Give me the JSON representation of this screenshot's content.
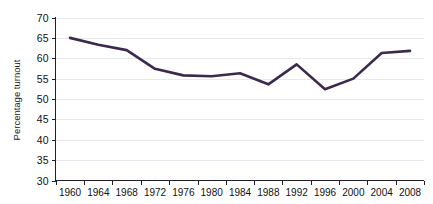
{
  "chart_data": {
    "type": "line",
    "title": "",
    "subtitle": "",
    "xlabel": "",
    "ylabel": "Percentage turnout",
    "x": [
      1960,
      1964,
      1968,
      1972,
      1976,
      1980,
      1984,
      1988,
      1992,
      1996,
      2000,
      2004,
      2008
    ],
    "x_tick_labels": [
      "1960",
      "1964",
      "1968",
      "1972",
      "1976",
      "1980",
      "1984",
      "1988",
      "1992",
      "1996",
      "2000",
      "2004",
      "2008"
    ],
    "y_tick_labels": [
      "70",
      "65",
      "60",
      "55",
      "50",
      "45",
      "40",
      "35",
      "30"
    ],
    "y_ticks": [
      70,
      65,
      60,
      55,
      50,
      45,
      40,
      35,
      30
    ],
    "ylim": [
      30,
      70
    ],
    "xlim": [
      1960,
      2008
    ],
    "grid": true,
    "grid_axis": "y",
    "legend": false,
    "legend_position": "none",
    "series": [
      {
        "name": "Percentage turnout",
        "color": "#3c2a4d",
        "values": [
          65.0,
          63.3,
          62.0,
          57.4,
          55.8,
          55.6,
          56.3,
          53.6,
          58.5,
          52.4,
          55.0,
          61.3,
          61.8
        ]
      }
    ],
    "annotations": []
  },
  "colors": {
    "line": "#3c2a4d",
    "gridline": "#e9e9ef",
    "axis": "#231f26",
    "text": "#111111",
    "background": "#ffffff"
  }
}
